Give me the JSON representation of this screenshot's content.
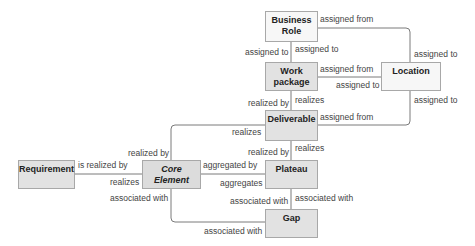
{
  "nodes": {
    "business_role": "Business\nRole",
    "business_role_l1": "Business",
    "business_role_l2": "Role",
    "work_package_l1": "Work",
    "work_package_l2": "package",
    "location": "Location",
    "deliverable": "Deliverable",
    "plateau": "Plateau",
    "gap": "Gap",
    "requirement": "Requirement",
    "core_element_l1": "Core",
    "core_element_l2": "Element"
  },
  "edges": {
    "br_loc_from": "assigned from",
    "br_wp_to_left": "assigned to",
    "br_wp_to_right": "assigned to",
    "loc_top_to": "assigned to",
    "wp_loc_from": "assigned from",
    "wp_loc_to": "assigned to",
    "loc_bottom_to": "assigned to",
    "wp_del_realized_by": "realized by",
    "wp_del_realizes": "realizes",
    "del_loc_from": "assigned from",
    "core_del_realized_by": "realized by",
    "core_del_realizes": "realizes",
    "del_plat_realized_by": "realized by",
    "del_plat_realizes": "realizes",
    "req_core_is_realized_by": "is realized by",
    "req_core_realizes": "realizes",
    "core_plat_aggregated_by": "aggregated by",
    "core_plat_aggregates": "aggregates",
    "plat_gap_assoc_left": "associated with",
    "plat_gap_assoc_right": "associated with",
    "core_gap_assoc_top": "associated with",
    "core_gap_assoc_bottom": "associated with"
  },
  "colors": {
    "line": "#7a7a7a",
    "border": "#a8a8a8",
    "white_fill": "#f7f7f7",
    "gray_fill": "#e2e2e2"
  }
}
